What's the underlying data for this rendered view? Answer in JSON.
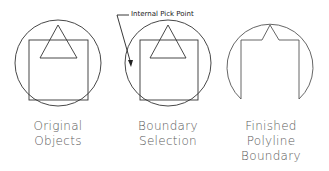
{
  "colors": {
    "stroke": "#333333",
    "label": "#5a5a5a"
  },
  "callout": {
    "text": "Internal Pick Point"
  },
  "figures": [
    {
      "id": "original",
      "label_lines": [
        "Original",
        "Objects"
      ]
    },
    {
      "id": "selection",
      "label_lines": [
        "Boundary",
        "Selection"
      ]
    },
    {
      "id": "finished",
      "label_lines": [
        "Finished",
        "Polyline",
        "Boundary"
      ]
    }
  ]
}
